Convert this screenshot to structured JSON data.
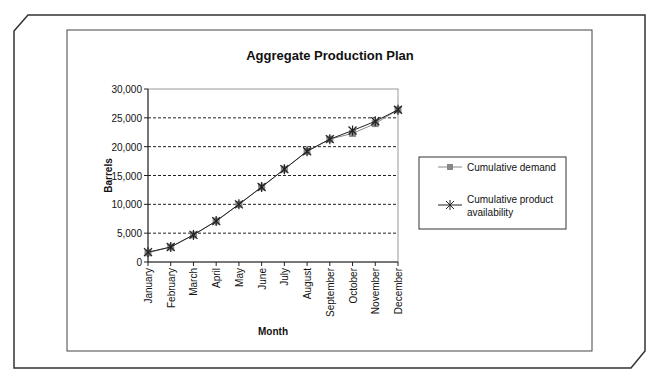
{
  "chart_data": {
    "type": "line",
    "title": "Aggregate Production Plan",
    "xlabel": "Month",
    "ylabel": "Barrels",
    "ylim": [
      0,
      30000
    ],
    "yticks": [
      "0",
      "5,000",
      "10,000",
      "15,000",
      "20,000",
      "25,000",
      "30,000"
    ],
    "grid": true,
    "legend_position": "right",
    "categories": [
      "January",
      "February",
      "March",
      "April",
      "May",
      "June",
      "July",
      "August",
      "September",
      "October",
      "November",
      "December"
    ],
    "series": [
      {
        "name": "Cumulative demand",
        "marker": "square",
        "color": "#888888",
        "values": [
          1600,
          2600,
          4700,
          7100,
          10000,
          13000,
          16100,
          19200,
          21300,
          22300,
          24000,
          26400
        ]
      },
      {
        "name": "Cumulative product availability",
        "marker": "star",
        "color": "#222222",
        "values": [
          1700,
          2600,
          4700,
          7100,
          10000,
          13000,
          16100,
          19200,
          21300,
          22800,
          24400,
          26400
        ]
      }
    ]
  }
}
